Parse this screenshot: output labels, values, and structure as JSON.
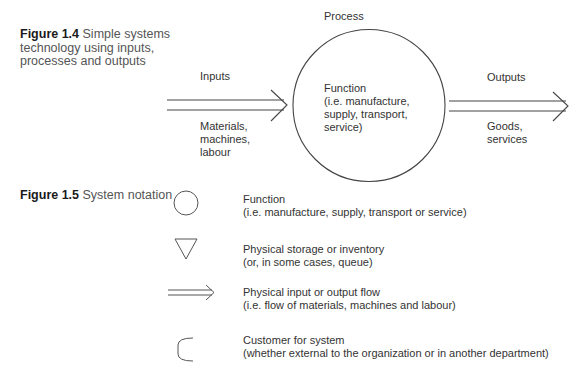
{
  "figure_1_4": {
    "caption_number": "Figure 1.4",
    "caption_lines": [
      "Simple systems",
      "technology using inputs,",
      "processes and outputs"
    ],
    "process_label": "Process",
    "function_lines": [
      "Function",
      "(i.e. manufacture,",
      "supply, transport,",
      "service)"
    ],
    "inputs": {
      "label": "Inputs",
      "detail_lines": [
        "Materials,",
        "machines,",
        "labour"
      ]
    },
    "outputs": {
      "label": "Outputs",
      "detail_lines": [
        "Goods,",
        "services"
      ]
    }
  },
  "figure_1_5": {
    "caption_number": "Figure 1.5",
    "caption_text": "System notation",
    "legend": [
      {
        "icon": "circle-icon",
        "title": "Function",
        "detail": "(i.e. manufacture, supply, transport or service)"
      },
      {
        "icon": "triangle-icon",
        "title": "Physical storage or inventory",
        "detail": "(or, in some cases, queue)"
      },
      {
        "icon": "double-arrow-icon",
        "title": "Physical input or output flow",
        "detail": "(i.e. flow of materials, machines and labour)"
      },
      {
        "icon": "customer-bracket-icon",
        "title": "Customer for system",
        "detail": "(whether external to the organization or in another department)"
      }
    ]
  }
}
